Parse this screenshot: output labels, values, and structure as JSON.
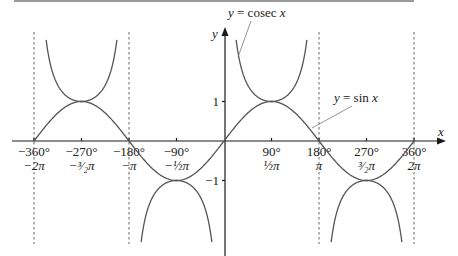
{
  "chart_data": {
    "type": "line",
    "title": "",
    "xlabel": "x",
    "ylabel": "y",
    "xlim_deg": [
      -360,
      360
    ],
    "ylim": [
      -2.6,
      2.6
    ],
    "x_ticks": [
      {
        "deg": -360,
        "deg_label": "−360°",
        "rad_label": "−2π"
      },
      {
        "deg": -270,
        "deg_label": "−270°",
        "rad_label": "−³⁄₂π"
      },
      {
        "deg": -180,
        "deg_label": "−180°",
        "rad_label": "−π"
      },
      {
        "deg": -90,
        "deg_label": "−90°",
        "rad_label": "−½π"
      },
      {
        "deg": 90,
        "deg_label": "90°",
        "rad_label": "½π"
      },
      {
        "deg": 180,
        "deg_label": "180°",
        "rad_label": "π"
      },
      {
        "deg": 270,
        "deg_label": "270°",
        "rad_label": "³⁄₂π"
      },
      {
        "deg": 360,
        "deg_label": "360°",
        "rad_label": "2π"
      }
    ],
    "y_ticks": [
      {
        "value": 1,
        "label": "1"
      },
      {
        "value": -1,
        "label": "−1"
      }
    ],
    "asymptotes_deg": [
      -360,
      -180,
      180,
      360
    ],
    "series": [
      {
        "name": "y = sin x",
        "function": "sin",
        "domain_deg": [
          -360,
          360
        ]
      },
      {
        "name": "y = cosec x",
        "function": "cosec",
        "domain_deg": [
          -360,
          360
        ],
        "clip": 2.6
      }
    ],
    "annotations": [
      {
        "text": "y = cosec x",
        "points_to": "cosec branch near x = 15°"
      },
      {
        "text": "y = sin x",
        "points_to": "sin curve near x = 170°"
      }
    ],
    "grid": false,
    "legend": "none"
  }
}
